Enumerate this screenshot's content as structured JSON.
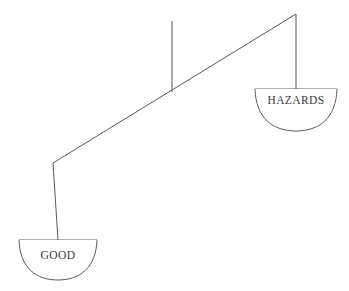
{
  "figure": {
    "name": "balance-scale",
    "background_color": "#ffffff",
    "line_color": "#595959",
    "text_color": "#3c3c3c"
  },
  "pans": {
    "left": {
      "label": "GOOD",
      "state": "lowered",
      "rim": {
        "x1": 19,
        "y1": 240,
        "x2": 97,
        "y2": 240
      },
      "bowl_depth": 40,
      "label_x": 58,
      "label_y": 259
    },
    "right": {
      "label": "HAZARDS",
      "state": "raised",
      "rim": {
        "x1": 255,
        "y1": 89,
        "x2": 337,
        "y2": 89
      },
      "bowl_depth": 42,
      "label_x": 296,
      "label_y": 104
    }
  },
  "beam": {
    "left_end": {
      "x": 53,
      "y": 163
    },
    "right_end": {
      "x": 296,
      "y": 14
    },
    "fulcrum": {
      "x": 172,
      "y": 91
    }
  },
  "post": {
    "top": {
      "x": 172,
      "y": 21
    },
    "bottom": {
      "x": 172,
      "y": 92
    }
  },
  "hangers": {
    "left": {
      "x1": 53,
      "y1": 163,
      "x2": 58,
      "y2": 240
    },
    "right": {
      "x1": 296,
      "y1": 14,
      "x2": 296,
      "y2": 89
    }
  }
}
